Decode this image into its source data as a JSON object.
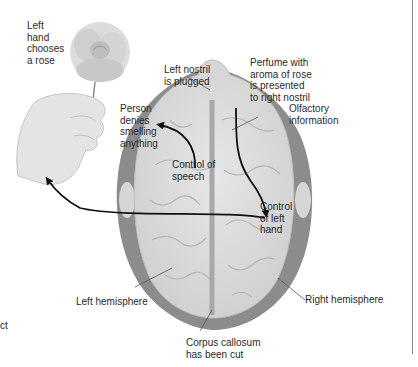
{
  "diagram": {
    "labels": {
      "left_hand": "Left\nhand\nchooses\na rose",
      "left_nostril": "Left nostril\nis plugged",
      "perfume": "Perfume with\naroma of rose\nis presented\nto right nostril",
      "person_denies": "Person\ndenies\nsmelling\nanything",
      "olfactory": "Olfactory\ninformation",
      "control_speech": "Control of\nspeech",
      "control_left_hand": "Control\nof left\nhand",
      "left_hemisphere": "Left hemisphere",
      "right_hemisphere": "Right hemisphere",
      "corpus_callosum": "Corpus callosum\nhas been cut",
      "cut_fragment": "ct"
    },
    "icons": [
      "rose-illustration",
      "hand-illustration",
      "brain-top-view"
    ],
    "colors": {
      "background": "#ffffff",
      "brain_fill": "#d9d9d9",
      "brain_shadow": "#8c8c8c",
      "arrow": "#111111",
      "leader_line": "#555555",
      "text": "#2a2a2a"
    }
  }
}
